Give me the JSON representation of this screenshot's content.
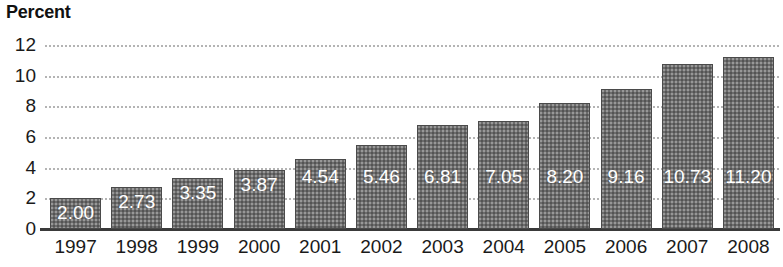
{
  "chart_data": {
    "type": "bar",
    "title": "Percent",
    "xlabel": "",
    "ylabel": "Percent",
    "ylim": [
      0,
      12
    ],
    "yticks": [
      0,
      2,
      4,
      6,
      8,
      10,
      12
    ],
    "ytick_labels": [
      "0",
      "2",
      "4",
      "6",
      "8",
      "10",
      "12"
    ],
    "grid": true,
    "grid_style": "dotted-horizontal",
    "legend": null,
    "categories": [
      "1997",
      "1998",
      "1999",
      "2000",
      "2001",
      "2002",
      "2003",
      "2004",
      "2005",
      "2006",
      "2007",
      "2008"
    ],
    "values": [
      2.0,
      2.73,
      3.35,
      3.87,
      4.54,
      5.46,
      6.81,
      7.05,
      8.2,
      9.16,
      10.73,
      11.2
    ],
    "data_labels": [
      "2.00",
      "2.73",
      "3.35",
      "3.87",
      "4.54",
      "5.46",
      "6.81",
      "7.05",
      "8.20",
      "9.16",
      "10.73",
      "11.20"
    ],
    "bar_color": "#6c6c6c",
    "bar_border_color": "#4a4a4a",
    "data_label_color": "#ffffff",
    "gridline_color": "#b4b4b4",
    "axis_color": "#3a3a3a",
    "background_color": "#ffffff"
  }
}
